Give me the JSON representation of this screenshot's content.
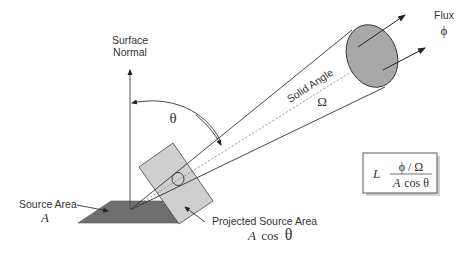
{
  "labels": {
    "surface_normal_line1": "Surface",
    "surface_normal_line2": "Normal",
    "theta": "θ",
    "solid_angle": "Solid Angle",
    "omega": "Ω",
    "flux": "Flux",
    "phi": "ϕ",
    "source_area": "Source Area",
    "source_area_symbol": "A",
    "projected_source_area": "Projected Source Area",
    "projected_A": "A",
    "projected_cos": "cos",
    "projected_theta": "θ"
  },
  "formula": {
    "lhs": "L",
    "numerator": "ϕ / Ω",
    "denominator_A": "A",
    "denominator_rest": "cos θ"
  },
  "colors": {
    "source_area_fill": "#6e6e6e",
    "projected_area_fill": "#cfcfcf",
    "ellipse_fill": "#a8a8a8",
    "line": "#333333"
  }
}
